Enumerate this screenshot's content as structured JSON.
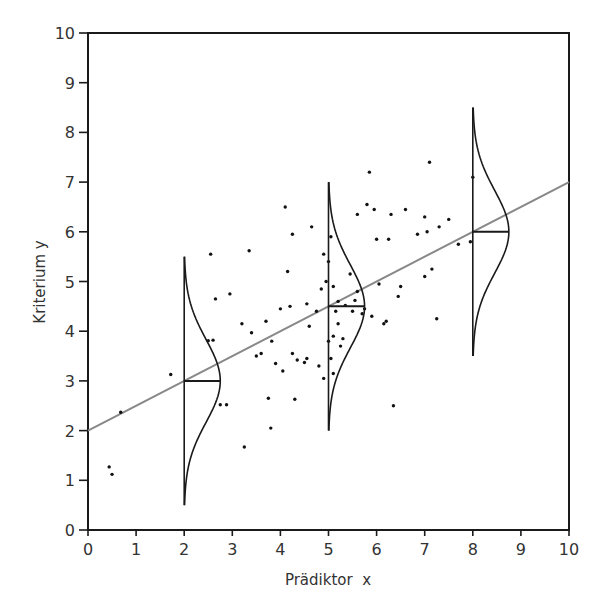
{
  "chart_data": {
    "type": "scatter",
    "title": "",
    "xlabel": "Prädiktor  x",
    "ylabel": "Kriterium y",
    "xlim": [
      0,
      10
    ],
    "ylim": [
      0,
      10
    ],
    "xticks": [
      0,
      1,
      2,
      3,
      4,
      5,
      6,
      7,
      8,
      9,
      10
    ],
    "yticks": [
      0,
      1,
      2,
      3,
      4,
      5,
      6,
      7,
      8,
      9,
      10
    ],
    "grid": false,
    "legend": null,
    "regression_line": {
      "intercept": 2.0,
      "slope": 0.5,
      "x_range": [
        0,
        10
      ],
      "color": "#888888"
    },
    "conditional_distributions": [
      {
        "x": 2,
        "mean": 3.0,
        "y_range": [
          0.5,
          5.5
        ],
        "width": 0.75
      },
      {
        "x": 5,
        "mean": 4.5,
        "y_range": [
          2.0,
          7.0
        ],
        "width": 0.75
      },
      {
        "x": 8,
        "mean": 6.0,
        "y_range": [
          3.5,
          8.5
        ],
        "width": 0.75
      }
    ],
    "series": [
      {
        "name": "observations",
        "points": [
          [
            0.44,
            1.27
          ],
          [
            0.5,
            1.12
          ],
          [
            0.68,
            2.37
          ],
          [
            1.72,
            3.13
          ],
          [
            2.5,
            3.81
          ],
          [
            2.6,
            3.82
          ],
          [
            2.65,
            4.65
          ],
          [
            2.55,
            5.55
          ],
          [
            2.75,
            2.52
          ],
          [
            2.88,
            2.52
          ],
          [
            2.95,
            4.75
          ],
          [
            3.2,
            4.15
          ],
          [
            3.25,
            1.67
          ],
          [
            3.35,
            5.62
          ],
          [
            3.4,
            3.97
          ],
          [
            3.5,
            3.5
          ],
          [
            3.6,
            3.55
          ],
          [
            3.7,
            4.2
          ],
          [
            3.75,
            2.65
          ],
          [
            3.8,
            2.05
          ],
          [
            3.82,
            3.8
          ],
          [
            3.9,
            3.35
          ],
          [
            4.0,
            4.45
          ],
          [
            4.05,
            3.2
          ],
          [
            4.1,
            6.5
          ],
          [
            4.15,
            5.2
          ],
          [
            4.2,
            4.5
          ],
          [
            4.25,
            5.95
          ],
          [
            4.25,
            3.55
          ],
          [
            4.3,
            2.63
          ],
          [
            4.35,
            3.42
          ],
          [
            4.5,
            3.37
          ],
          [
            4.55,
            3.45
          ],
          [
            4.55,
            4.55
          ],
          [
            4.6,
            4.1
          ],
          [
            4.65,
            6.1
          ],
          [
            4.75,
            4.4
          ],
          [
            4.8,
            3.3
          ],
          [
            4.85,
            4.85
          ],
          [
            4.9,
            3.05
          ],
          [
            4.9,
            5.55
          ],
          [
            4.95,
            5.0
          ],
          [
            5.0,
            5.4
          ],
          [
            5.0,
            3.8
          ],
          [
            5.05,
            5.9
          ],
          [
            5.05,
            3.45
          ],
          [
            5.1,
            4.9
          ],
          [
            5.1,
            3.9
          ],
          [
            5.1,
            3.15
          ],
          [
            5.15,
            4.4
          ],
          [
            5.2,
            4.6
          ],
          [
            5.2,
            4.15
          ],
          [
            5.25,
            3.7
          ],
          [
            5.3,
            3.85
          ],
          [
            5.35,
            4.52
          ],
          [
            5.45,
            5.15
          ],
          [
            5.5,
            4.4
          ],
          [
            5.55,
            4.62
          ],
          [
            5.6,
            4.8
          ],
          [
            5.6,
            6.35
          ],
          [
            5.7,
            4.35
          ],
          [
            5.75,
            4.45
          ],
          [
            5.8,
            6.55
          ],
          [
            5.85,
            7.2
          ],
          [
            5.95,
            6.45
          ],
          [
            5.9,
            4.3
          ],
          [
            6.0,
            5.85
          ],
          [
            6.05,
            4.95
          ],
          [
            6.15,
            4.15
          ],
          [
            6.2,
            4.2
          ],
          [
            6.25,
            5.85
          ],
          [
            6.3,
            6.35
          ],
          [
            6.35,
            2.5
          ],
          [
            6.45,
            4.7
          ],
          [
            6.5,
            4.9
          ],
          [
            6.6,
            6.45
          ],
          [
            6.85,
            5.95
          ],
          [
            7.0,
            6.3
          ],
          [
            7.0,
            5.1
          ],
          [
            7.05,
            6.0
          ],
          [
            7.1,
            7.4
          ],
          [
            7.15,
            5.25
          ],
          [
            7.25,
            4.25
          ],
          [
            7.3,
            6.1
          ],
          [
            7.5,
            6.25
          ],
          [
            7.7,
            5.75
          ],
          [
            7.95,
            5.8
          ],
          [
            8.0,
            7.1
          ]
        ]
      }
    ]
  },
  "colors": {
    "axis": "#1a1a1a",
    "regression": "#888888",
    "distribution": "#1a1a1a",
    "points": "#111111",
    "text": "#333333"
  }
}
